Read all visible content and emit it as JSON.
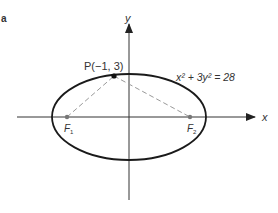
{
  "figure": {
    "panel_label": "a",
    "x_axis_label": "x",
    "y_axis_label": "y",
    "point_label": "P(−1, 3)",
    "equation": "x² + 3y² = 28",
    "focus1_label": "F",
    "focus1_sub": "1",
    "focus2_label": "F",
    "focus2_sub": "2",
    "colors": {
      "ellipse": "#1a1a1a",
      "axes": "#333333",
      "dashed": "#999999",
      "point": "#111111",
      "focus": "#777777"
    }
  }
}
